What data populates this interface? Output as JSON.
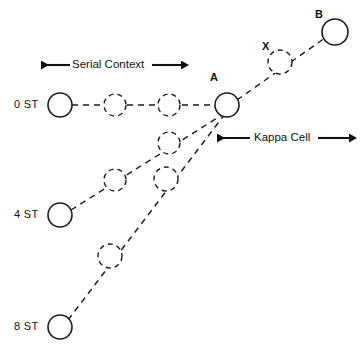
{
  "figure": {
    "background_color": "#ffffff",
    "stroke_color": "#1a1a1a",
    "width": 362,
    "height": 352
  },
  "row_labels": [
    {
      "id": "row-0st",
      "text": "0 ST",
      "x": 14,
      "y": 98
    },
    {
      "id": "row-4st",
      "text": "4 ST",
      "x": 14,
      "y": 208
    },
    {
      "id": "row-8st",
      "text": "8 ST",
      "x": 14,
      "y": 320
    }
  ],
  "node_labels": [
    {
      "id": "label-a",
      "text": "A",
      "x": 210,
      "y": 71
    },
    {
      "id": "label-x",
      "text": "X",
      "x": 262,
      "y": 40
    },
    {
      "id": "label-b",
      "text": "B",
      "x": 315,
      "y": 8
    }
  ],
  "annotations": [
    {
      "id": "serial-context",
      "text": "Serial Context",
      "arrow": "double",
      "x1": 40,
      "x2": 182,
      "y": 65,
      "label_x": 68,
      "label_y": 58
    },
    {
      "id": "kappa-cell",
      "text": "Kappa Cell",
      "arrow": "double",
      "x1": 216,
      "x2": 350,
      "y": 138,
      "label_x": 248,
      "label_y": 131
    }
  ],
  "nodes": [
    {
      "id": "n0-1",
      "row": "0 ST",
      "cx": 60,
      "cy": 105,
      "r": 12,
      "style": "solid"
    },
    {
      "id": "n0-2",
      "row": "0 ST",
      "cx": 115,
      "cy": 105,
      "r": 11,
      "style": "dashed"
    },
    {
      "id": "n0-3",
      "row": "0 ST",
      "cx": 169,
      "cy": 105,
      "r": 11,
      "style": "dashed"
    },
    {
      "id": "node-a",
      "row": "0 ST",
      "cx": 227,
      "cy": 105,
      "r": 12,
      "style": "solid"
    },
    {
      "id": "n4-1",
      "row": "4 ST",
      "cx": 60,
      "cy": 215,
      "r": 12,
      "style": "solid"
    },
    {
      "id": "n4-2",
      "row": "4 ST",
      "cx": 115,
      "cy": 180,
      "r": 11,
      "style": "dashed"
    },
    {
      "id": "n4-3",
      "row": "4 ST",
      "cx": 169,
      "cy": 143,
      "r": 11,
      "style": "dashed"
    },
    {
      "id": "n8-1",
      "row": "8 ST",
      "cx": 60,
      "cy": 327,
      "r": 12,
      "style": "solid"
    },
    {
      "id": "n8-2",
      "row": "8 ST",
      "cx": 110,
      "cy": 256,
      "r": 12,
      "style": "dashed"
    },
    {
      "id": "n8-3",
      "row": "8 ST",
      "cx": 166,
      "cy": 179,
      "r": 12,
      "style": "dashed"
    },
    {
      "id": "node-x",
      "row": "kappa",
      "cx": 280,
      "cy": 62,
      "r": 12,
      "style": "dashed"
    },
    {
      "id": "node-b",
      "row": "kappa",
      "cx": 335,
      "cy": 32,
      "r": 13,
      "style": "solid"
    }
  ],
  "edges": [
    {
      "id": "edge-0st-row",
      "from": "n0-1",
      "to": "node-a",
      "style": "dashed"
    },
    {
      "id": "edge-4st-diagonal",
      "from": "n4-1",
      "to": "node-a",
      "style": "dashed"
    },
    {
      "id": "edge-8st-diagonal",
      "from": "n8-1",
      "to": "node-a",
      "style": "dashed"
    },
    {
      "id": "edge-a-to-b",
      "from": "node-a",
      "to": "node-b",
      "style": "dashed"
    }
  ]
}
